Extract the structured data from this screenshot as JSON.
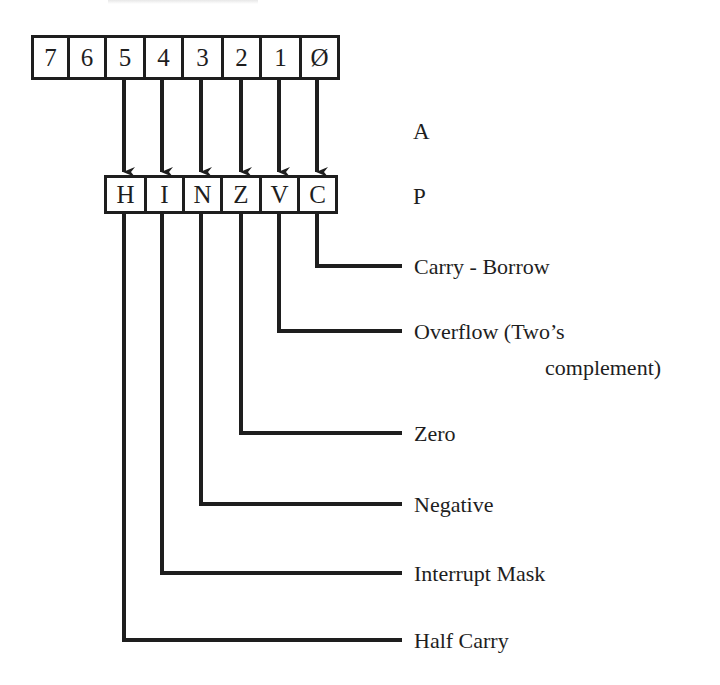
{
  "diagram": {
    "register_a": {
      "label": "A",
      "bits": [
        "7",
        "6",
        "5",
        "4",
        "3",
        "2",
        "1",
        "Ø"
      ]
    },
    "register_p": {
      "label": "P",
      "flags": [
        "H",
        "I",
        "N",
        "Z",
        "V",
        "C"
      ]
    },
    "flag_descriptions": [
      {
        "flag": "C",
        "line1": "Carry - Borrow",
        "line2": ""
      },
      {
        "flag": "V",
        "line1": "Overflow (Two’s",
        "line2": "complement)"
      },
      {
        "flag": "Z",
        "line1": "Zero",
        "line2": ""
      },
      {
        "flag": "N",
        "line1": "Negative",
        "line2": ""
      },
      {
        "flag": "I",
        "line1": "Interrupt Mask",
        "line2": ""
      },
      {
        "flag": "H",
        "line1": "Half Carry",
        "line2": ""
      }
    ],
    "mapping": [
      {
        "from_bit": "5",
        "to_flag": "H"
      },
      {
        "from_bit": "4",
        "to_flag": "I"
      },
      {
        "from_bit": "3",
        "to_flag": "N"
      },
      {
        "from_bit": "2",
        "to_flag": "Z"
      },
      {
        "from_bit": "1",
        "to_flag": "V"
      },
      {
        "from_bit": "Ø",
        "to_flag": "C"
      }
    ],
    "colors": {
      "ink": "#1e1e1e",
      "background": "#ffffff"
    }
  }
}
